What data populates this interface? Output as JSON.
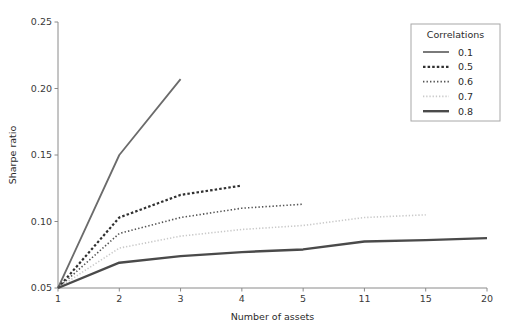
{
  "chart_data": {
    "type": "line",
    "title": "",
    "xlabel": "Number of assets",
    "ylabel": "Sharpe ratio",
    "x": [
      1,
      2,
      3,
      4,
      5,
      11,
      15,
      20
    ],
    "xtick_labels": [
      "1",
      "2",
      "3",
      "4",
      "5",
      "11",
      "15",
      "20"
    ],
    "ytick_labels": [
      "0.05",
      "0.10",
      "0.15",
      "0.20",
      "0.25"
    ],
    "ytick_values": [
      0.05,
      0.1,
      0.15,
      0.2,
      0.25
    ],
    "ylim": [
      0.05,
      0.25
    ],
    "grid": false,
    "legend_title": "Correlations",
    "legend_position": "upper right",
    "series": [
      {
        "name": "0.1",
        "label": "0.1",
        "color": "#6b6b6b",
        "linestyle": "solid",
        "linewidth": 1.8,
        "x": [
          1,
          2,
          3
        ],
        "values": [
          0.05,
          0.15,
          0.207
        ]
      },
      {
        "name": "0.5",
        "label": "0.5",
        "color": "#303030",
        "linestyle": "dashed",
        "linewidth": 2.2,
        "x": [
          1,
          2,
          3,
          4
        ],
        "values": [
          0.05,
          0.103,
          0.12,
          0.127
        ]
      },
      {
        "name": "0.6",
        "label": "0.6",
        "color": "#545454",
        "linestyle": "dotted",
        "linewidth": 1.6,
        "x": [
          1,
          2,
          3,
          4,
          5
        ],
        "values": [
          0.05,
          0.091,
          0.103,
          0.11,
          0.113
        ]
      },
      {
        "name": "0.7",
        "label": "0.7",
        "color": "#c9c9c9",
        "linestyle": "dotted-light",
        "linewidth": 1.6,
        "x": [
          1,
          2,
          3,
          4,
          5,
          11,
          15
        ],
        "values": [
          0.05,
          0.08,
          0.089,
          0.094,
          0.097,
          0.103,
          0.105
        ]
      },
      {
        "name": "0.8",
        "label": "0.8",
        "color": "#4a4a4a",
        "linestyle": "solid-thick",
        "linewidth": 2.4,
        "x": [
          1,
          2,
          3,
          4,
          5,
          11,
          15,
          20
        ],
        "values": [
          0.05,
          0.069,
          0.074,
          0.077,
          0.079,
          0.085,
          0.086,
          0.0875
        ]
      }
    ]
  }
}
